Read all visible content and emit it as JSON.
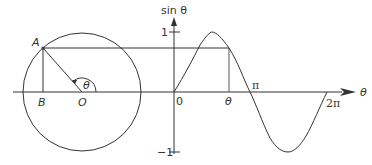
{
  "diagram": {
    "circle": {
      "points": {
        "A": "A",
        "B": "B",
        "O": "O"
      },
      "angle_label": "θ"
    },
    "graph": {
      "y_axis_label": "sin θ",
      "x_axis_label": "θ",
      "y_ticks": [
        "1",
        "−1"
      ],
      "x_ticks": [
        "0",
        "θ",
        "π",
        "2π"
      ]
    },
    "colors": {
      "stroke": "#333333",
      "background": "#ffffff"
    }
  }
}
